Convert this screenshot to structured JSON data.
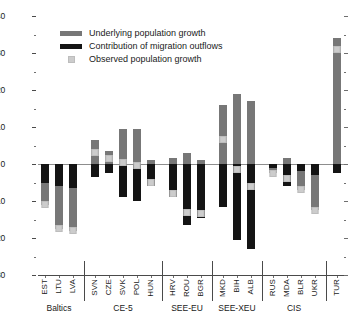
{
  "chart_data": {
    "type": "bar",
    "title": "",
    "subtitle": "",
    "xlabel": "",
    "ylabel": "",
    "ylim": [
      -30,
      40
    ],
    "yticks": [
      40,
      30,
      20,
      10,
      0,
      -10,
      -20,
      -30
    ],
    "ytick_labels": [
      "40",
      "30",
      "20",
      "10",
      "0",
      "-10",
      "-20",
      "-30"
    ],
    "minor_ticks": true,
    "grid": false,
    "stacked": true,
    "legend_position": "top-left",
    "legend": [
      {
        "key": "underlying",
        "label": "Underlying population growth",
        "color": "#777777",
        "marker": "bar"
      },
      {
        "key": "migration",
        "label": "Contribution of migration outflows",
        "color": "#141414",
        "marker": "bar"
      },
      {
        "key": "observed",
        "label": "Observed population growth",
        "color": "#cccccc",
        "marker": "square"
      }
    ],
    "categories": [
      "EST",
      "LTU",
      "LVA",
      "SVN",
      "CZE",
      "SVK",
      "POL",
      "HUN",
      "HRV",
      "ROU",
      "BGR",
      "MKD",
      "BIH",
      "ALB",
      "RUS",
      "MDA",
      "BLR",
      "UKR",
      "TUR"
    ],
    "groups": [
      {
        "label": "Baltics",
        "categories": [
          "EST",
          "LTU",
          "LVA"
        ]
      },
      {
        "label": "CE-5",
        "categories": [
          "SVN",
          "CZE",
          "SVK",
          "POL",
          "HUN"
        ]
      },
      {
        "label": "SEE-EU",
        "categories": [
          "HRV",
          "ROU",
          "BGR"
        ]
      },
      {
        "label": "SEE-XEU",
        "categories": [
          "MKD",
          "BIH",
          "ALB"
        ]
      },
      {
        "label": "CIS",
        "categories": [
          "RUS",
          "MDA",
          "BLR",
          "UKR"
        ]
      },
      {
        "label": "",
        "categories": [
          "TUR"
        ]
      }
    ],
    "series": [
      {
        "name": "Underlying population growth",
        "key": "underlying",
        "values": [
          -11.0,
          -17.5,
          -18.0,
          6.5,
          3.5,
          9.5,
          9.5,
          1.0,
          1.5,
          3.0,
          1.0,
          16.0,
          19.0,
          17.0,
          -2.5,
          1.5,
          -7.0,
          -12.5,
          34.0
        ]
      },
      {
        "name": "Contribution of migration outflows",
        "key": "migration",
        "values": [
          -5.0,
          -6.0,
          -6.5,
          -3.5,
          -2.5,
          -9.0,
          -10.0,
          -6.0,
          -9.0,
          -16.5,
          -14.5,
          -11.5,
          -20.5,
          -23.0,
          -1.0,
          -6.0,
          -2.0,
          -3.0,
          -2.5
        ]
      },
      {
        "name": "Observed population growth",
        "key": "observed",
        "values": [
          -11.0,
          -17.5,
          -18.0,
          3.0,
          1.5,
          0.5,
          -0.5,
          -5.0,
          -8.0,
          -13.0,
          -13.5,
          6.5,
          -1.5,
          -6.0,
          -2.5,
          -4.0,
          -7.0,
          -12.5,
          31.0
        ]
      }
    ]
  }
}
